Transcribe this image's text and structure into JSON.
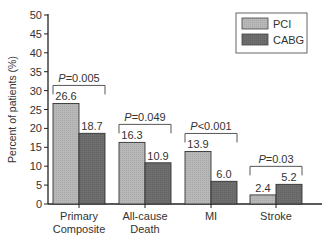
{
  "chart_data": {
    "type": "bar",
    "title": "",
    "xlabel": "",
    "ylabel": "Percent of patients (%)",
    "ylim": [
      0,
      50
    ],
    "yticks": [
      0,
      5,
      10,
      15,
      20,
      25,
      30,
      35,
      40,
      45,
      50
    ],
    "grid": false,
    "legend_position": "top-right",
    "categories": [
      "Primary Composite",
      "All-cause Death",
      "MI",
      "Stroke"
    ],
    "category_lines": [
      [
        "Primary",
        "Composite"
      ],
      [
        "All-cause",
        "Death"
      ],
      [
        "MI"
      ],
      [
        "Stroke"
      ]
    ],
    "series": [
      {
        "name": "PCI",
        "color": "#b8b8b8",
        "values": [
          26.6,
          16.3,
          13.9,
          2.4
        ]
      },
      {
        "name": "CABG",
        "color": "#6e6e6e",
        "values": [
          18.7,
          10.9,
          6.0,
          5.2
        ]
      }
    ],
    "annotations": [
      {
        "category": "Primary Composite",
        "text": "P=0.005",
        "prefix": "P",
        "rest": "=0.005"
      },
      {
        "category": "All-cause Death",
        "text": "P=0.049",
        "prefix": "P",
        "rest": "=0.049"
      },
      {
        "category": "MI",
        "text": "P<0.001",
        "prefix": "P",
        "rest": "<0.001"
      },
      {
        "category": "Stroke",
        "text": "P=0.03",
        "prefix": "P",
        "rest": "=0.03"
      }
    ],
    "value_labels": [
      [
        "26.6",
        "18.7"
      ],
      [
        "16.3",
        "10.9"
      ],
      [
        "13.9",
        "6.0"
      ],
      [
        "2.4",
        "5.2"
      ]
    ]
  }
}
